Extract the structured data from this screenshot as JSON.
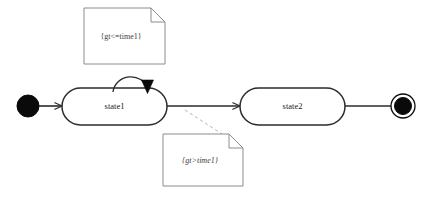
{
  "diagram": {
    "type": "uml-state-machine",
    "title": "",
    "colors": {
      "background": "#ffffff",
      "stroke": "#2b2b2b",
      "note_stroke": "#8c8c8c",
      "note_text": "#3a3a3a",
      "state_text": "#1a1a1a",
      "dashed_connector": "#b0b0b0",
      "node_fill": "#ffffff",
      "pseudostate_fill": "#000000"
    },
    "nodes": [
      {
        "id": "initial",
        "kind": "initial-pseudostate",
        "label": "",
        "cx": 28,
        "cy": 106,
        "r": 11
      },
      {
        "id": "state1",
        "kind": "state",
        "label": "state1",
        "x": 62,
        "y": 88,
        "width": 105,
        "height": 37
      },
      {
        "id": "state2",
        "kind": "state",
        "label": "state2",
        "x": 240,
        "y": 88,
        "width": 105,
        "height": 37
      },
      {
        "id": "final",
        "kind": "final-state",
        "label": "",
        "cx": 403,
        "cy": 106,
        "r_outer": 12,
        "r_inner": 8.5
      }
    ],
    "transitions": [
      {
        "id": "t-initial-state1",
        "from": "initial",
        "to": "state1",
        "label": "",
        "arrowhead": "open"
      },
      {
        "id": "t-state1-self",
        "from": "state1",
        "to": "state1",
        "label": "",
        "arrowhead": "filled",
        "kind": "self-loop"
      },
      {
        "id": "t-state1-state2",
        "from": "state1",
        "to": "state2",
        "label": "",
        "arrowhead": "open"
      },
      {
        "id": "t-state2-final",
        "from": "state2",
        "to": "final",
        "label": "",
        "arrowhead": "none"
      }
    ],
    "notes": [
      {
        "id": "note-self-guard",
        "text": "{gt<=time1}",
        "italic": false,
        "x": 84,
        "y": 8,
        "width": 81,
        "height": 56,
        "fold": 14,
        "anchored_to": "t-state1-self",
        "connector": false
      },
      {
        "id": "note-transition-guard",
        "text": "{gt>time1}",
        "italic": true,
        "x": 163,
        "y": 134,
        "width": 80,
        "height": 52,
        "fold": 14,
        "anchored_to": "t-state1-state2",
        "connector": true
      }
    ]
  }
}
